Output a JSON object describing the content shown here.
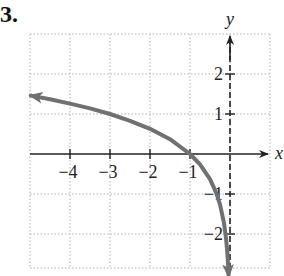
{
  "problem": {
    "number_label": "3."
  },
  "chart_data": {
    "type": "line",
    "title": "",
    "xlabel": "x",
    "ylabel": "y",
    "xlim": [
      -5,
      1
    ],
    "ylim": [
      -3,
      3
    ],
    "grid": true,
    "grid_style": "dotted",
    "x_ticks": [
      -4,
      -3,
      -2,
      -1
    ],
    "x_tick_labels": [
      "−4",
      "−3",
      "−2",
      "−1"
    ],
    "y_ticks": [
      -2,
      -1,
      1,
      2
    ],
    "y_tick_labels": [
      "−2",
      "−1",
      "1",
      "2"
    ],
    "asymptote": {
      "type": "vertical",
      "x": 0,
      "style": "dashed"
    },
    "series": [
      {
        "name": "y = log₃(−x)",
        "color": "#707070",
        "arrows": "both",
        "points": [
          [
            -4.98,
            1.46
          ],
          [
            -4.5,
            1.37
          ],
          [
            -4,
            1.26
          ],
          [
            -3.5,
            1.14
          ],
          [
            -3,
            1.0
          ],
          [
            -2.5,
            0.83
          ],
          [
            -2,
            0.63
          ],
          [
            -1.5,
            0.37
          ],
          [
            -1,
            0.0
          ],
          [
            -0.75,
            -0.26
          ],
          [
            -0.5,
            -0.63
          ],
          [
            -0.35,
            -0.96
          ],
          [
            -0.25,
            -1.26
          ],
          [
            -0.15,
            -1.73
          ],
          [
            -0.1,
            -2.1
          ],
          [
            -0.07,
            -2.42
          ],
          [
            -0.05,
            -2.73
          ],
          [
            -0.035,
            -3.05
          ]
        ]
      }
    ],
    "key_points": [
      {
        "x": -1,
        "y": 0,
        "note": "x-intercept"
      }
    ]
  },
  "colors": {
    "axis": "#222222",
    "grid": "#b0b0b0",
    "curve": "#707070",
    "background": "#ffffff"
  }
}
